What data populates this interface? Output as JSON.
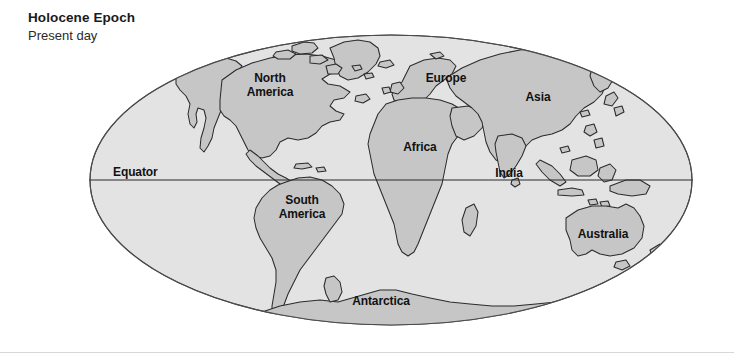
{
  "figure": {
    "title": "Holocene Epoch",
    "subtitle": "Present day",
    "kind": "world-paleogeographic-map"
  },
  "map": {
    "projection_shape": "ellipse",
    "equator_label": "Equator",
    "landmasses": [
      {
        "id": "north-america",
        "label": "North America",
        "label_lines": [
          "North",
          "America"
        ]
      },
      {
        "id": "europe",
        "label": "Europe",
        "label_lines": [
          "Europe"
        ]
      },
      {
        "id": "asia",
        "label": "Asia",
        "label_lines": [
          "Asia"
        ]
      },
      {
        "id": "africa",
        "label": "Africa",
        "label_lines": [
          "Africa"
        ]
      },
      {
        "id": "india",
        "label": "India",
        "label_lines": [
          "India"
        ]
      },
      {
        "id": "south-america",
        "label": "South America",
        "label_lines": [
          "South",
          "America"
        ]
      },
      {
        "id": "australia",
        "label": "Australia",
        "label_lines": [
          "Australia"
        ]
      },
      {
        "id": "antarctica",
        "label": "Antarctica",
        "label_lines": [
          "Antarctica"
        ]
      }
    ],
    "labels": {
      "north_america_line1": "North",
      "north_america_line2": "America",
      "europe": "Europe",
      "asia": "Asia",
      "africa": "Africa",
      "india": "India",
      "south_america_line1": "South",
      "south_america_line2": "America",
      "australia": "Australia",
      "antarctica": "Antarctica",
      "equator": "Equator"
    }
  },
  "colors": {
    "page_background": "#ffffff",
    "ocean_fill": "#e3e3e3",
    "land_fill": "#c6c6c6",
    "outline_stroke": "#2b2b2b",
    "equator_line": "#2b2b2b",
    "title_text": "#1a1a1a",
    "bottom_rule": "#d8d8d8"
  }
}
